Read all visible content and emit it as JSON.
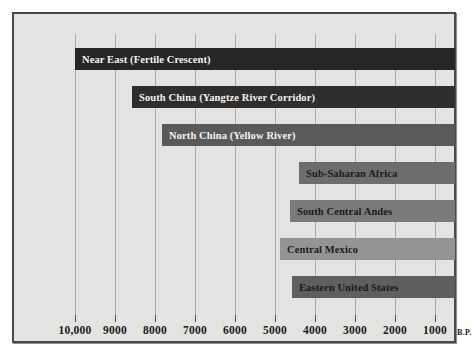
{
  "chart_data": {
    "type": "bar",
    "orientation": "horizontal",
    "title": "",
    "xlabel": "B.P.",
    "ylabel": "",
    "xlim": [
      10000,
      500
    ],
    "x_reversed": true,
    "grid": true,
    "legend": false,
    "xticks": [
      "10,000",
      "9000",
      "8000",
      "7000",
      "6000",
      "5000",
      "4000",
      "3000",
      "2000",
      "1000"
    ],
    "xtick_values": [
      10000,
      9000,
      8000,
      7000,
      6000,
      5000,
      4000,
      3000,
      2000,
      1000
    ],
    "axis_suffix": "B.P.",
    "bar_end": 500,
    "categories": [
      "Near East (Fertile Crescent)",
      "South China (Yangtze River Corridor)",
      "North China (Yellow River)",
      "Sub-Saharan Africa",
      "South Central Andes",
      "Central Mexico",
      "Eastern United States"
    ],
    "bars": [
      {
        "label": "Near East (Fertile Crescent)",
        "start": 10000,
        "end": 500,
        "color": "#272727",
        "text_color": "#f2f2f0"
      },
      {
        "label": "South China (Yangtze River Corridor)",
        "start": 8575,
        "end": 500,
        "color": "#2e2e2e",
        "text_color": "#f2f2f0"
      },
      {
        "label": "North China (Yellow River)",
        "start": 7825,
        "end": 500,
        "color": "#5a5a5a",
        "text_color": "#f2f2f0"
      },
      {
        "label": "Sub-Saharan Africa",
        "start": 4400,
        "end": 500,
        "color": "#6d6d6d",
        "text_color": "#1b1b1b"
      },
      {
        "label": "South Central Andes",
        "start": 4625,
        "end": 500,
        "color": "#7a7a7a",
        "text_color": "#1b1b1b"
      },
      {
        "label": "Central Mexico",
        "start": 4875,
        "end": 500,
        "color": "#949494",
        "text_color": "#1b1b1b"
      },
      {
        "label": "Eastern United States",
        "start": 4575,
        "end": 500,
        "color": "#5f5f5f",
        "text_color": "#1b1b1b"
      }
    ]
  },
  "colors": {
    "plate_background": "#e3e3e1",
    "frame": "#4a4a4a",
    "gridline": "#a9a9a7",
    "tick": "#4f4f4f",
    "text": "#1b1b1b"
  }
}
